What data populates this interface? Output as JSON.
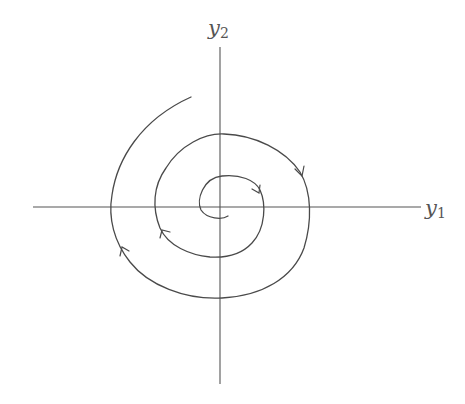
{
  "figure": {
    "type": "phase-portrait",
    "axes": {
      "x_label": {
        "var": "y",
        "sub": "1"
      },
      "y_label": {
        "var": "y",
        "sub": "2"
      }
    },
    "colors": {
      "stroke": "#4a4a4a",
      "axis": "#555555",
      "background": "#ffffff"
    },
    "trajectory": {
      "direction": "clockwise-inward",
      "arrow_count": 4
    }
  }
}
